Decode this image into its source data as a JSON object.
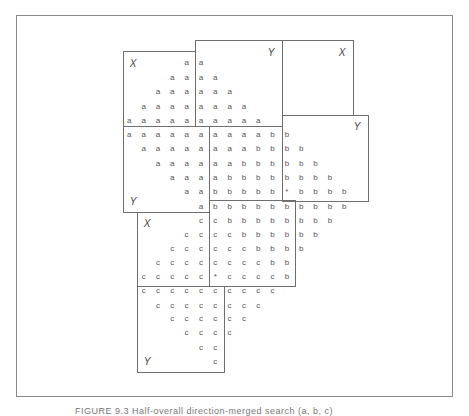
{
  "figure": {
    "caption": "FIGURE 9.3 Half-overall direction-merged search (a, b, c)",
    "grid": {
      "origin_x": 129.3,
      "col_spacing": 14.33,
      "row_y": [
        63.3,
        78,
        92.3,
        106.7,
        121,
        135,
        149.3,
        163.7,
        178,
        192.3,
        206.7,
        220.7,
        234.7,
        248.7,
        262.7,
        277,
        291.3,
        305.7,
        319.3,
        333.3,
        347.7,
        361.7
      ],
      "rows": [
        "    aa          ",
        "   aaaa         ",
        "  aaaaaa        ",
        " aaaaaaaa       ",
        "aaaaaaaaaa      ",
        "aaaaaaaaaabb    ",
        " aaaaaaaabbbb   ",
        "  aaaaaabbbbbb  ",
        "   aaaabbbbbbbb ",
        "    aabbbbb*bbbb",
        "     abbbbbbbbbb",
        "     ccbbbbbbbb ",
        "    ccccbbbbbb  ",
        "   ccccccbbbb   ",
        "  ccccccccbb    ",
        " ccccc*ccccb    ",
        " cccccccccc     ",
        "  cccccccc      ",
        "   cccccc       ",
        "    cccc        ",
        "     cc         ",
        "      c         "
      ]
    },
    "boxes": [
      {
        "id": "box-a",
        "x": 123,
        "y": 51,
        "w": 73,
        "h": 76,
        "label": "X",
        "lx": 133,
        "ly": 63
      },
      {
        "id": "box-b",
        "x": 195,
        "y": 40,
        "w": 88,
        "h": 87,
        "label": "Y",
        "lx": 271,
        "ly": 52
      },
      {
        "id": "box-c",
        "x": 282,
        "y": 40,
        "w": 72,
        "h": 76,
        "label": "X",
        "lx": 342,
        "ly": 52
      },
      {
        "id": "box-d",
        "x": 123,
        "y": 126,
        "w": 87,
        "h": 87,
        "label": "Y",
        "lx": 133,
        "ly": 201
      },
      {
        "id": "box-e",
        "x": 282,
        "y": 115,
        "w": 87,
        "h": 87,
        "label": "Y",
        "lx": 357,
        "ly": 126
      },
      {
        "id": "box-f",
        "x": 209,
        "y": 200,
        "w": 87,
        "h": 87,
        "label": "",
        "lx": 0,
        "ly": 0
      },
      {
        "id": "box-g",
        "x": 137,
        "y": 212,
        "w": 73,
        "h": 75,
        "label": "X",
        "lx": 147,
        "ly": 223
      },
      {
        "id": "box-h",
        "x": 137,
        "y": 286,
        "w": 88,
        "h": 87,
        "label": "Y",
        "lx": 147,
        "ly": 361
      }
    ]
  }
}
